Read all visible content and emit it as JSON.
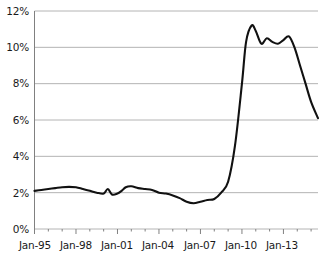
{
  "chart_data": {
    "type": "line",
    "title": "",
    "subtitle": "",
    "xlabel": "",
    "ylabel": "",
    "grid": true,
    "legend": null,
    "xlim": [
      "Jan-95",
      "Jul-15"
    ],
    "ylim": [
      0,
      12
    ],
    "y_ticks": [
      0,
      2,
      4,
      6,
      8,
      10,
      12
    ],
    "y_tick_labels": [
      "0%",
      "2%",
      "4%",
      "6%",
      "8%",
      "10%",
      "12%"
    ],
    "x_tick_labels": [
      "Jan-95",
      "Jan-98",
      "Jan-01",
      "Jan-04",
      "Jan-07",
      "Jan-10",
      "Jan-13"
    ],
    "x_tick_years": [
      1995,
      1998,
      2001,
      2004,
      2007,
      2010,
      2013
    ],
    "x_minor_tick_interval_years": 1,
    "line_color": "#111111",
    "grid_color": "#b4b4b4",
    "axis_color": "#808080",
    "series": [
      {
        "name": "rate",
        "x": [
          1995.0,
          1995.5,
          1996.0,
          1996.5,
          1997.0,
          1997.5,
          1998.0,
          1998.5,
          1999.0,
          1999.5,
          2000.0,
          2000.3,
          2000.6,
          2001.0,
          2001.3,
          2001.6,
          2002.0,
          2002.5,
          2003.0,
          2003.5,
          2004.0,
          2004.5,
          2005.0,
          2005.5,
          2006.0,
          2006.5,
          2007.0,
          2007.5,
          2008.0,
          2008.5,
          2009.0,
          2009.5,
          2010.0,
          2010.3,
          2010.7,
          2011.0,
          2011.4,
          2011.8,
          2012.2,
          2012.6,
          2013.0,
          2013.4,
          2013.8,
          2014.2,
          2014.6,
          2015.0,
          2015.5
        ],
        "values": [
          2.1,
          2.15,
          2.2,
          2.25,
          2.3,
          2.32,
          2.3,
          2.2,
          2.1,
          2.0,
          1.95,
          2.2,
          1.9,
          1.95,
          2.1,
          2.3,
          2.35,
          2.25,
          2.2,
          2.15,
          2.0,
          1.95,
          1.85,
          1.7,
          1.5,
          1.42,
          1.5,
          1.6,
          1.65,
          2.0,
          2.6,
          4.6,
          8.0,
          10.3,
          11.2,
          10.9,
          10.2,
          10.5,
          10.3,
          10.2,
          10.4,
          10.6,
          10.0,
          9.0,
          8.0,
          7.0,
          6.1
        ]
      }
    ]
  },
  "axis": {
    "y_labels": [
      "12%",
      "10%",
      "8%",
      "6%",
      "4%",
      "2%",
      "0%"
    ],
    "x_labels": [
      "Jan-95",
      "Jan-98",
      "Jan-01",
      "Jan-04",
      "Jan-07",
      "Jan-10",
      "Jan-13"
    ]
  }
}
